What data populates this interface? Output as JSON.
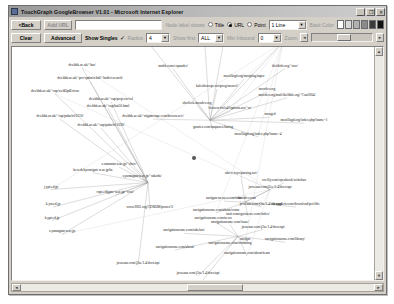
{
  "window": {
    "title": "TouchGraph GoogleBrowser V1.01 - Microsoft Internet Explorer",
    "app_icon": "globe-icon",
    "minimize_glyph": "_",
    "maximize_glyph": "❐",
    "close_glyph": "✕"
  },
  "toolbar_row1": {
    "back_label": "<Back",
    "add_url_label": "Add URL",
    "url_value": "",
    "url_placeholder": "",
    "node_label_shows": "Node label shows",
    "radio_title": "Title",
    "radio_url": "URL",
    "radio_point": "Point",
    "selected_radio": "URL",
    "line_select_value": "1 Line",
    "back_color_label": "Back Color",
    "swatches": [
      "#ffffff",
      "#d8d8d8",
      "#b0b0b0",
      "#8a8a8a",
      "#3a3a3a",
      "#111111"
    ]
  },
  "toolbar_row2": {
    "clear_label": "Clear",
    "advanced_label": "Advanced",
    "show_singles_label": "Show Singles",
    "show_singles_checked": true,
    "check_glyph": "✓",
    "radius_label": "Radius",
    "radius_value": "4",
    "show_first_label": "Show first",
    "show_first_value": "ALL",
    "min_inbound_label": "Min Inbound",
    "min_inbound_value": "0",
    "zoom_label": "Zoom",
    "arrow_down_glyph": "▼",
    "arrow_left_glyph": "◄",
    "arrow_right_glyph": "►",
    "arrow_up_glyph": "▲"
  },
  "graph": {
    "hub": {
      "label": "dcs.bbk.ac.uk",
      "x": 196,
      "y": 163
    },
    "nodes": [
      {
        "label": "theldobi.org/~Can2004/journal/",
        "x": 205,
        "y": 13
      },
      {
        "label": "help.netscape.com/netscape6/en",
        "x": 228,
        "y": 25
      },
      {
        "label": "netscape.com/eng/intl/poli.html/plugins/you.tml",
        "x": 150,
        "y": 39
      },
      {
        "label": "gamebandgo.org",
        "x": 285,
        "y": 39
      },
      {
        "label": "dcs.bbk.ac.uk/~bar/",
        "x": 84,
        "y": 65
      },
      {
        "label": "stuffit.com/expander/",
        "x": 175,
        "y": 66
      },
      {
        "label": "theldobi.org/~raw/",
        "x": 287,
        "y": 66
      },
      {
        "label": "dcs.bbk.ac.uk/~prc/optimix.bdi/~bath/research/",
        "x": 92,
        "y": 79
      },
      {
        "label": "mozillagd.org/mozplug/super",
        "x": 246,
        "y": 77
      },
      {
        "label": "kaleidoscope.net/prog/mozrel/",
        "x": 219,
        "y": 87
      },
      {
        "label": "mozdev.org",
        "x": 269,
        "y": 90
      },
      {
        "label": "mozdev.org/mail/thelibbi.org/~Can2004/",
        "x": 289,
        "y": 96
      },
      {
        "label": "dcs.bbk.ac.uk/~cap/webOptEctcuz",
        "x": 57,
        "y": 92
      },
      {
        "label": "dcs.bbk.ac.uk/~cap/projects/col",
        "x": 113,
        "y": 100
      },
      {
        "label": "sherlock.mozdev.org",
        "x": 199,
        "y": 104
      },
      {
        "label": "dcs.bbk.ac.uk/~cap/hat50.html",
        "x": 110,
        "y": 107
      },
      {
        "label": "flowers-fwl.t4?options.net/~sr/",
        "x": 232,
        "y": 110
      },
      {
        "label": "mozged",
        "x": 272,
        "y": 116
      },
      {
        "label": "dcs.bbk.ac.uk/~cap/pubs/tr10110/",
        "x": 62,
        "y": 118
      },
      {
        "label": "dcs.bbk.ac.uk/~nfgattroupe.com/browsers/c/",
        "x": 155,
        "y": 118
      },
      {
        "label": "banner.mozdev.org",
        "x": 212,
        "y": 121
      },
      {
        "label": "mozillagd.org/index.php?name=1",
        "x": 306,
        "y": 122
      },
      {
        "label": "dcs.bbk.ac.uk/~cap/pubs/tr11030/",
        "x": 103,
        "y": 127
      },
      {
        "label": "gnuries.com/taupaxes/haring",
        "x": 215,
        "y": 129
      },
      {
        "label": "mozillagd.org/index.php?name=4",
        "x": 260,
        "y": 136
      },
      {
        "label": "dcs.bbk.ac.uk",
        "x": 196,
        "y": 163
      },
      {
        "label": "s.xamanta-u.ac.jp/~chov/",
        "x": 121,
        "y": 167
      },
      {
        "label": "keverb.kyomigate-u.ac.jp/be",
        "x": 95,
        "y": 173
      },
      {
        "label": "ubo-c.toyo/parsing.net/",
        "x": 243,
        "y": 176
      },
      {
        "label": "s.yamagata-u.ac.jp/~rakoda/",
        "x": 144,
        "y": 179
      },
      {
        "label": "oreilly.com/openbook/webchan",
        "x": 286,
        "y": 183
      },
      {
        "label": "java.sun.com/j2ee/1.4/docs/api",
        "x": 272,
        "y": 190
      },
      {
        "label": "j.ypt.ed.jp",
        "x": 53,
        "y": 190
      },
      {
        "label": "cspt.edijgate-u.ac.jp/~cost/",
        "x": 117,
        "y": 196
      },
      {
        "label": "navigatessesses.com/mks/",
        "x": 226,
        "y": 202
      },
      {
        "label": "mozdev.com",
        "x": 249,
        "y": 202
      },
      {
        "label": "java.sun.com/j2se/1.4/docs/api",
        "x": 263,
        "y": 208
      },
      {
        "label": "k.yst.ed.jp",
        "x": 55,
        "y": 208
      },
      {
        "label": "www2002.org/CDROM/poster/3/",
        "x": 152,
        "y": 211
      },
      {
        "label": "deapplerit.com/download/perl/dis",
        "x": 298,
        "y": 208
      },
      {
        "label": "navigationsome.com/about/conta",
        "x": 218,
        "y": 214
      },
      {
        "label": "trait.comogwinesse.com/index/",
        "x": 250,
        "y": 218
      },
      {
        "label": "k.ypt.ed.jp",
        "x": 54,
        "y": 222
      },
      {
        "label": "navigationsome.com/news",
        "x": 215,
        "y": 222
      },
      {
        "label": "s.yamagata-u.ac.jp",
        "x": 64,
        "y": 236
      },
      {
        "label": "navigationsome.com/issue/",
        "x": 232,
        "y": 226
      },
      {
        "label": "java.sun.com/j2se/1.4/docs/api",
        "x": 265,
        "y": 231
      },
      {
        "label": "navigationsome.com/rabelais/",
        "x": 186,
        "y": 235
      },
      {
        "label": "navigat",
        "x": 247,
        "y": 244
      },
      {
        "label": "navigationsome.com/library/",
        "x": 287,
        "y": 244
      },
      {
        "label": "navigationsome.com/trimming",
        "x": 232,
        "y": 248
      },
      {
        "label": "navigationsome.com/about/",
        "x": 177,
        "y": 252
      },
      {
        "label": "navigationsome.com/about/team",
        "x": 249,
        "y": 258
      },
      {
        "label": "java.sun.com/j2se/1.4/docs/api",
        "x": 140,
        "y": 268
      },
      {
        "label": "java.sun.com/j2se/1.4/docs/api",
        "x": 200,
        "y": 279
      },
      {
        "label": "navigationsome.net",
        "x": 200,
        "y": 289
      }
    ],
    "edge_color": "#9a9a9a",
    "hub_node_color": "#555555"
  }
}
